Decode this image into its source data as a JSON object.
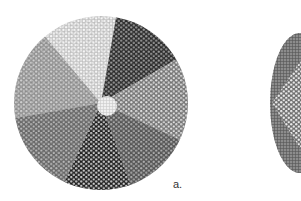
{
  "figure": {
    "panel_label": "a.",
    "disks": [
      {
        "name": "disk-a",
        "cx": 101,
        "cy": 103,
        "r": 87,
        "sectors": [
          {
            "start": -100,
            "end": -40,
            "fill": "#9a9a9a",
            "dot": "#ffffff"
          },
          {
            "start": -40,
            "end": 10,
            "fill": "#d8d8d8",
            "dot": "#ffffff"
          },
          {
            "start": 10,
            "end": 60,
            "fill": "#2a2a2a",
            "dot": "#9a9a9a"
          },
          {
            "start": 60,
            "end": 115,
            "fill": "#7a7a7a",
            "dot": "#bbbbbb"
          },
          {
            "start": 115,
            "end": 160,
            "fill": "#555555",
            "dot": "#aaaaaa"
          },
          {
            "start": 160,
            "end": 205,
            "fill": "#1e1e1e",
            "dot": "#888888"
          },
          {
            "start": 205,
            "end": 260,
            "fill": "#6a6a6a",
            "dot": "#ffffff"
          }
        ],
        "center_fill": "#f0f0f0"
      },
      {
        "name": "disk-b",
        "cx": 340,
        "cy": 103,
        "r": 70,
        "sectors": [
          {
            "start": 0,
            "end": 360,
            "fill": "#8c8c8c",
            "dot": "#ffffff"
          }
        ],
        "center_fill": "#6e6e6e"
      }
    ],
    "colors": {
      "background": "#ffffff",
      "ink": "#222222"
    }
  }
}
